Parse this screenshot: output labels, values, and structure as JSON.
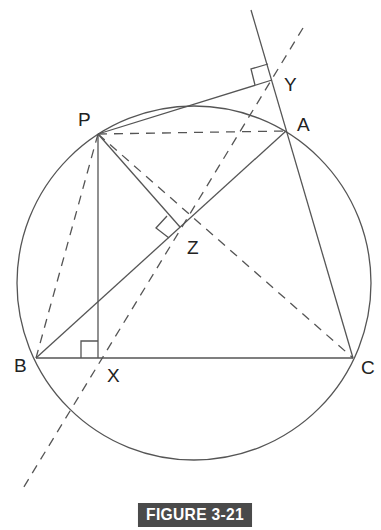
{
  "figure": {
    "caption": "FIGURE 3-21",
    "caption_bg": "#4a4a4a",
    "line_color": "#555555",
    "points": {
      "P": {
        "label": "P",
        "x": 98,
        "y": 134
      },
      "A": {
        "label": "A",
        "x": 286,
        "y": 131
      },
      "B": {
        "label": "B",
        "x": 36,
        "y": 358
      },
      "C": {
        "label": "C",
        "x": 353,
        "y": 358
      },
      "X": {
        "label": "X",
        "x": 98,
        "y": 358
      },
      "Y": {
        "label": "Y",
        "x": 272,
        "y": 80
      },
      "Z": {
        "label": "Z",
        "x": 180,
        "y": 227
      }
    },
    "circle": {
      "cx": 194,
      "cy": 283,
      "r": 177
    }
  }
}
